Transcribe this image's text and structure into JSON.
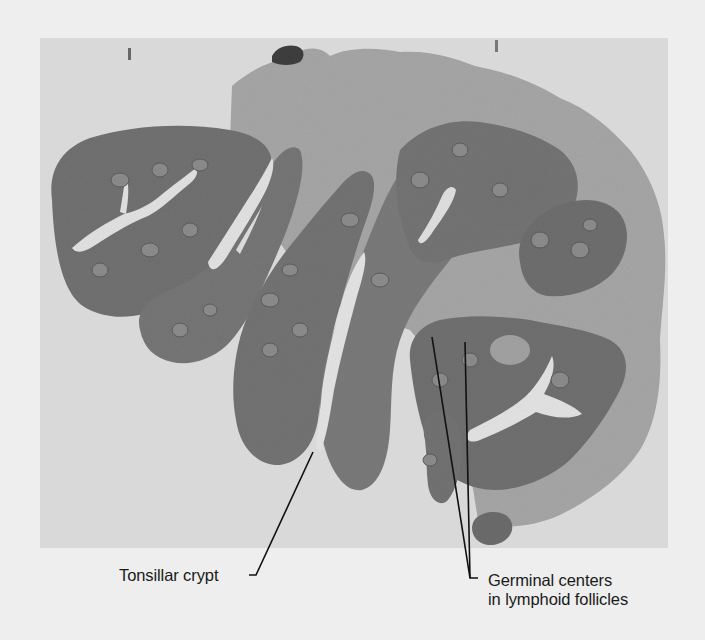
{
  "figure": {
    "colors": {
      "page_background": "#eeeeee",
      "slide_background": "#d9d9d9",
      "tissue_dark": "#6f6f6f",
      "tissue_mid": "#8a8a8a",
      "connective_tissue": "#a9a9a9",
      "crypt_lumen": "#e2e2e2",
      "leader_line": "#111111",
      "label_text": "#1a1a1a"
    },
    "annotations": [
      {
        "label": "Tonsillar crypt",
        "points_to": "crypt opening between lobes"
      },
      {
        "label": "Germinal centers\nin lymphoid follicles",
        "line1": "Germinal centers",
        "line2": "in lymphoid follicles",
        "points_to": "two follicles"
      }
    ]
  },
  "labels": {
    "tonsillar_crypt": "Tonsillar crypt",
    "germinal_line1": "Germinal centers",
    "germinal_line2": "in lymphoid follicles"
  }
}
